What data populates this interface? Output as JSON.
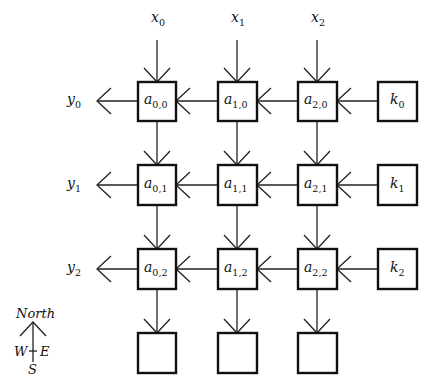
{
  "diagram": {
    "title": "",
    "inputs_top": [
      {
        "base": "x",
        "sub": "0"
      },
      {
        "base": "x",
        "sub": "1"
      },
      {
        "base": "x",
        "sub": "2"
      }
    ],
    "outputs_left": [
      {
        "base": "y",
        "sub": "0"
      },
      {
        "base": "y",
        "sub": "1"
      },
      {
        "base": "y",
        "sub": "2"
      }
    ],
    "cells": [
      [
        {
          "base": "a",
          "sub": "0,0"
        },
        {
          "base": "a",
          "sub": "1,0"
        },
        {
          "base": "a",
          "sub": "2,0"
        },
        {
          "base": "k",
          "sub": "0"
        }
      ],
      [
        {
          "base": "a",
          "sub": "0,1"
        },
        {
          "base": "a",
          "sub": "1,1"
        },
        {
          "base": "a",
          "sub": "2,1"
        },
        {
          "base": "k",
          "sub": "1"
        }
      ],
      [
        {
          "base": "a",
          "sub": "0,2"
        },
        {
          "base": "a",
          "sub": "1,2"
        },
        {
          "base": "a",
          "sub": "2,2"
        },
        {
          "base": "k",
          "sub": "2"
        }
      ],
      [
        {
          "base": "",
          "sub": ""
        },
        {
          "base": "",
          "sub": ""
        },
        {
          "base": "",
          "sub": ""
        }
      ]
    ],
    "compass": {
      "north": "North",
      "west": "W",
      "east": "E",
      "south": "S"
    },
    "colors": {
      "stroke": "#111111",
      "background": "#ffffff"
    }
  }
}
